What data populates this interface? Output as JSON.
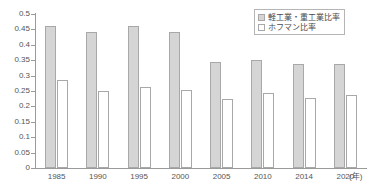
{
  "chart_data": {
    "type": "bar",
    "title": "",
    "xlabel": "年",
    "ylabel": "",
    "ylim": [
      0,
      0.5
    ],
    "ytick_labels": [
      "0.5",
      "0.45",
      "0.4",
      "0.35",
      "0.3",
      "0.25",
      "0.2",
      "0.15",
      "0.1",
      "0.05",
      "0"
    ],
    "ytick_values": [
      0.5,
      0.45,
      0.4,
      0.35,
      0.3,
      0.25,
      0.2,
      0.15,
      0.1,
      0.05,
      0
    ],
    "grid": false,
    "legend_position": "top-right",
    "categories": [
      "1985",
      "1990",
      "1995",
      "2000",
      "2005",
      "2010",
      "2014",
      "2020"
    ],
    "series": [
      {
        "name": "軽工業・重工業比率",
        "color": "#d5d5d5",
        "values": [
          0.462,
          0.443,
          0.462,
          0.443,
          0.345,
          0.352,
          0.337,
          0.339
        ]
      },
      {
        "name": "ホフマン比率",
        "color": "#ffffff",
        "values": [
          0.287,
          0.251,
          0.262,
          0.253,
          0.225,
          0.245,
          0.228,
          0.238
        ]
      }
    ]
  },
  "axis": {
    "unit_label": "(年)"
  },
  "legend": {
    "items": [
      {
        "label": "軽工業・重工業比率",
        "swatch": "primary"
      },
      {
        "label": "ホフマン比率",
        "swatch": "secondary"
      }
    ]
  }
}
